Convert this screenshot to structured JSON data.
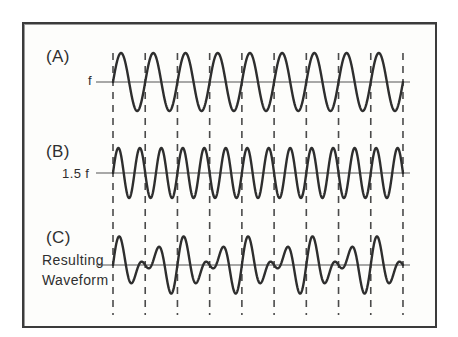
{
  "figure": {
    "background_color": "#fdfdfb",
    "page_color": "#ffffff",
    "border_color": "#3b3b3b",
    "trace_color": "#2e2e2e",
    "axis_color": "#555555",
    "dash_color": "#4a4a4a"
  },
  "labels": {
    "panel_a": "(A)",
    "panel_a_axis": "f",
    "panel_b": "(B)",
    "panel_b_axis": "1.5 f",
    "panel_c": "(C)",
    "panel_c_caption_line1": "Resulting",
    "panel_c_caption_line2": "Waveform"
  },
  "chart_data": {
    "type": "line",
    "xlabel": "",
    "ylabel": "",
    "grid": false,
    "legend_position": "none",
    "x_domain": [
      0,
      9
    ],
    "x_unit": "periods of f",
    "gridline_count": 10,
    "gridline_positions": [
      0,
      1,
      2,
      3,
      4,
      5,
      6,
      7,
      8,
      9
    ],
    "gridline_style": "dashed-vertical",
    "series": [
      {
        "name": "(A) f",
        "label": "f",
        "function": "sin(2*pi*x)",
        "frequency": 1.0,
        "amplitude": 1.0,
        "phase": 0,
        "cycles_shown": 9,
        "ylim": [
          -1.2,
          1.2
        ],
        "plot_top": 53,
        "plot_zero": 82,
        "plot_bottom": 111
      },
      {
        "name": "(B) 1.5 f",
        "label": "1.5 f",
        "function": "sin(2*pi*1.5*x)",
        "frequency": 1.5,
        "amplitude": 1.0,
        "phase": 0,
        "cycles_shown": 13.5,
        "ylim": [
          -1.2,
          1.2
        ],
        "plot_top": 148,
        "plot_zero": 173,
        "plot_bottom": 198
      },
      {
        "name": "(C) Resulting Waveform",
        "label": "Resulting Waveform",
        "function": "sin(2*pi*x) + sin(2*pi*1.5*x)",
        "frequency": 0.5,
        "amplitude": 2.0,
        "phase": 0,
        "beat_period_in_f_periods": 2,
        "ylim": [
          -2.2,
          2.2
        ],
        "plot_top": 235,
        "plot_zero": 265,
        "plot_bottom": 315
      }
    ]
  },
  "geometry": {
    "x_start": 113,
    "x_end": 403,
    "period_px": 32.22,
    "dash_top": 53,
    "dash_bottom": 315,
    "axis_line_left": 96,
    "axis_line_right": 410
  }
}
